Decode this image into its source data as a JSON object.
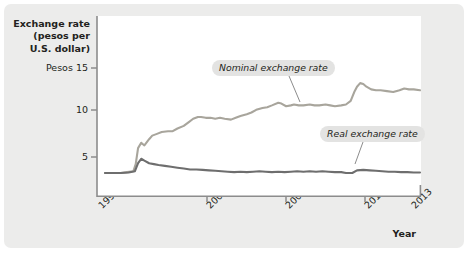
{
  "figure": {
    "panel_bg": "#ececeb",
    "plot_bg": "#ffffff",
    "axis_color": "#8c8c8c",
    "text_color": "#231f20"
  },
  "axes": {
    "y_title_line1": "Exchange rate",
    "y_title_line2": "(pesos per",
    "y_title_line3": "U.S. dollar)",
    "x_title": "Year",
    "y_ticks": [
      {
        "label": "Pesos 15",
        "value": 15
      },
      {
        "label": "10",
        "value": 10
      },
      {
        "label": "5",
        "value": 5
      }
    ],
    "x_ticks": [
      {
        "label": "1993",
        "value": 1993
      },
      {
        "label": "2000",
        "value": 2000
      },
      {
        "label": "2005",
        "value": 2005
      },
      {
        "label": "2010",
        "value": 2010
      },
      {
        "label": "2013",
        "value": 2013
      }
    ]
  },
  "annotations": {
    "nominal_label": "Nominal exchange rate",
    "real_label": "Real exchange rate"
  },
  "chart_data": {
    "type": "line",
    "title": "",
    "xlabel": "Year",
    "ylabel": "Exchange rate (pesos per U.S. dollar)",
    "xlim": [
      1993,
      2013
    ],
    "ylim": [
      0,
      17
    ],
    "ytick_values": [
      5,
      10,
      15
    ],
    "xtick_values": [
      1993,
      2000,
      2005,
      2010,
      2013
    ],
    "grid": false,
    "legend": "inline-annotations",
    "colors": {
      "nominal": "#a8a59c",
      "real": "#6e6e6e"
    },
    "series": [
      {
        "name": "Nominal exchange rate",
        "color": "#a8a59c",
        "x": [
          1993.0,
          1993.5,
          1994.0,
          1994.4,
          1994.8,
          1994.95,
          1995.1,
          1995.3,
          1995.5,
          1995.8,
          1996.0,
          1996.3,
          1996.6,
          1997.0,
          1997.3,
          1997.6,
          1998.0,
          1998.3,
          1998.6,
          1998.9,
          1999.1,
          1999.4,
          1999.7,
          2000.0,
          2000.3,
          2000.6,
          2001.0,
          2001.3,
          2001.6,
          2002.0,
          2002.3,
          2002.6,
          2003.0,
          2003.3,
          2003.6,
          2004.0,
          2004.2,
          2004.5,
          2004.8,
          2005.0,
          2005.3,
          2005.6,
          2006.0,
          2006.3,
          2006.6,
          2007.0,
          2007.3,
          2007.6,
          2008.0,
          2008.3,
          2008.6,
          2008.85,
          2009.0,
          2009.2,
          2009.4,
          2009.6,
          2009.9,
          2010.2,
          2010.5,
          2010.9,
          2011.3,
          2011.7,
          2012.0,
          2012.3,
          2012.6,
          2013.0
        ],
        "y": [
          3.2,
          3.2,
          3.2,
          3.3,
          3.4,
          4.2,
          6.0,
          6.6,
          6.3,
          7.0,
          7.4,
          7.6,
          7.8,
          7.9,
          7.9,
          8.2,
          8.5,
          8.9,
          9.3,
          9.5,
          9.5,
          9.4,
          9.4,
          9.3,
          9.4,
          9.3,
          9.2,
          9.4,
          9.6,
          9.8,
          10.0,
          10.3,
          10.5,
          10.6,
          10.8,
          11.1,
          11.0,
          10.7,
          10.8,
          10.9,
          10.8,
          10.8,
          10.9,
          10.8,
          10.8,
          10.9,
          10.8,
          10.7,
          10.8,
          10.9,
          11.3,
          12.4,
          12.9,
          13.3,
          13.2,
          12.9,
          12.6,
          12.5,
          12.5,
          12.4,
          12.3,
          12.5,
          12.7,
          12.6,
          12.6,
          12.5
        ],
        "units": "pesos per U.S. dollar"
      },
      {
        "name": "Real exchange rate",
        "color": "#6e6e6e",
        "x": [
          1993.0,
          1993.5,
          1994.0,
          1994.5,
          1994.9,
          1995.1,
          1995.3,
          1995.5,
          1995.8,
          1996.1,
          1996.4,
          1996.8,
          1997.2,
          1997.6,
          1998.0,
          1998.4,
          1998.8,
          1999.2,
          1999.6,
          2000.0,
          2000.4,
          2000.8,
          2001.2,
          2001.6,
          2002.0,
          2002.4,
          2002.8,
          2003.2,
          2003.6,
          2004.0,
          2004.4,
          2004.8,
          2005.2,
          2005.6,
          2006.0,
          2006.4,
          2006.8,
          2007.2,
          2007.6,
          2008.0,
          2008.3,
          2008.7,
          2009.0,
          2009.4,
          2009.8,
          2010.2,
          2010.6,
          2011.0,
          2011.4,
          2011.8,
          2012.2,
          2012.6,
          2013.0
        ],
        "y": [
          3.2,
          3.2,
          3.2,
          3.25,
          3.4,
          4.3,
          4.8,
          4.6,
          4.3,
          4.2,
          4.1,
          4.0,
          3.9,
          3.8,
          3.7,
          3.6,
          3.6,
          3.55,
          3.5,
          3.45,
          3.4,
          3.35,
          3.3,
          3.35,
          3.3,
          3.35,
          3.4,
          3.35,
          3.3,
          3.35,
          3.3,
          3.35,
          3.4,
          3.35,
          3.4,
          3.35,
          3.4,
          3.35,
          3.3,
          3.3,
          3.2,
          3.2,
          3.5,
          3.55,
          3.5,
          3.45,
          3.4,
          3.35,
          3.35,
          3.3,
          3.3,
          3.25,
          3.25
        ],
        "units": "pesos per U.S. dollar"
      }
    ]
  }
}
